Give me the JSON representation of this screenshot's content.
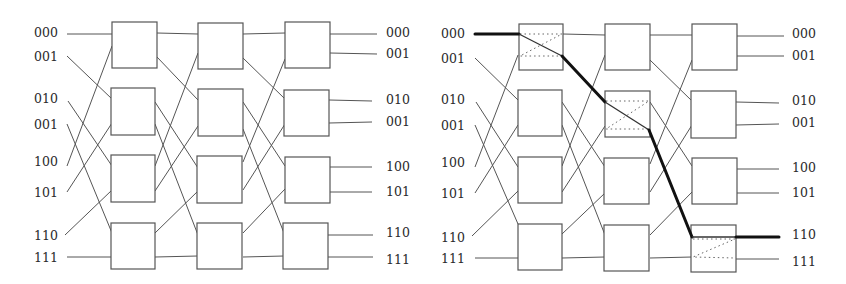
{
  "figure": {
    "colors": {
      "wire": "#555555",
      "box": "#555555",
      "highlight_path": "#111111",
      "background": "#ffffff"
    }
  },
  "left_network": {
    "input_labels": [
      "000",
      "001",
      "010",
      "001",
      "100",
      "101",
      "110",
      "111"
    ],
    "output_labels": [
      "000",
      "001",
      "010",
      "001",
      "100",
      "101",
      "110",
      "111"
    ],
    "stages": 3,
    "switches_per_stage": 4
  },
  "right_network": {
    "input_labels": [
      "000",
      "001",
      "010",
      "001",
      "100",
      "101",
      "110",
      "111"
    ],
    "output_labels": [
      "000",
      "001",
      "010",
      "001",
      "100",
      "101",
      "110",
      "111"
    ],
    "stages": 3,
    "switches_per_stage": 4,
    "highlighted_route": {
      "source": "000",
      "destination": "110",
      "switches": [
        "stage1-switch1",
        "stage2-switch2",
        "stage3-switch4"
      ]
    }
  }
}
